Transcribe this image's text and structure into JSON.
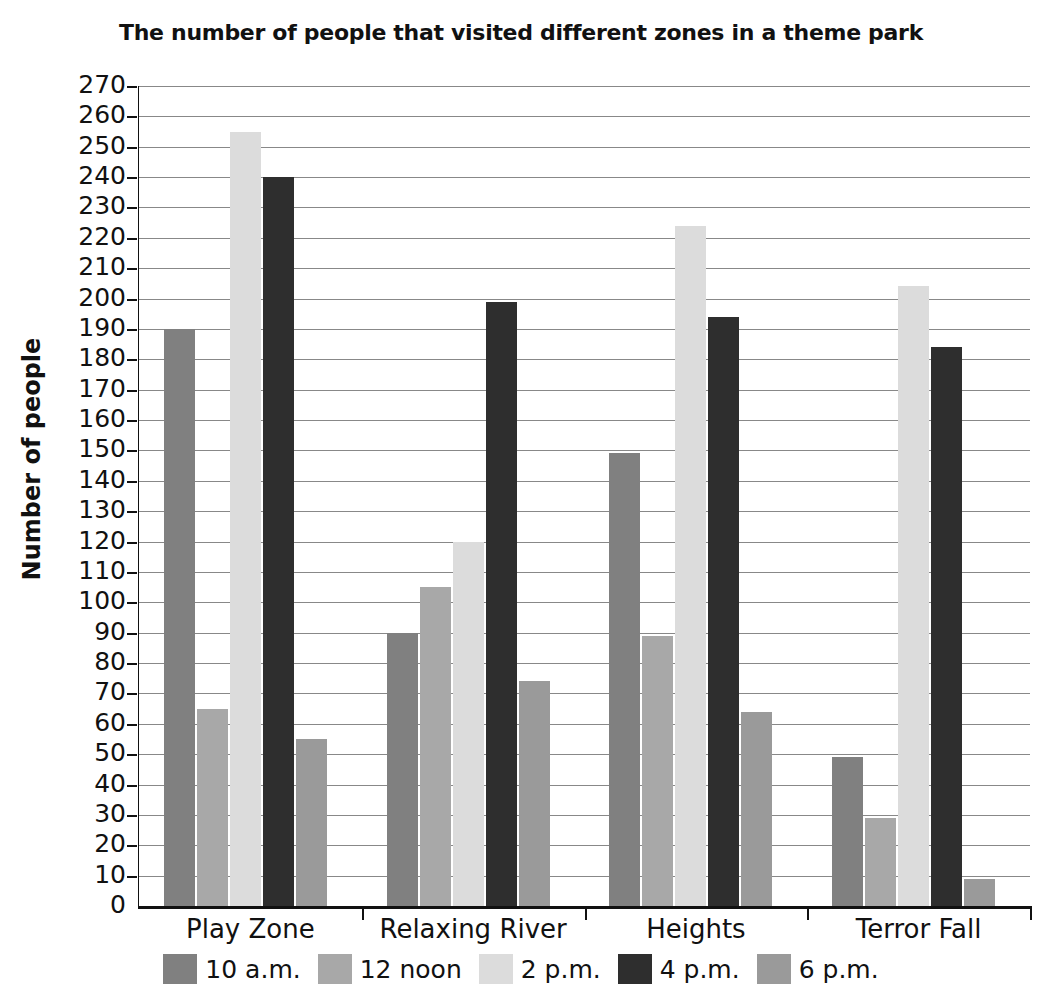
{
  "chart_data": {
    "type": "bar",
    "title": "The number of people that visited different zones in a theme park",
    "xlabel": "",
    "ylabel": "Number of people",
    "ylim": [
      0,
      270
    ],
    "ytick_step": 10,
    "yticks": [
      270,
      260,
      250,
      240,
      230,
      220,
      210,
      200,
      190,
      180,
      170,
      160,
      150,
      140,
      130,
      120,
      110,
      100,
      90,
      80,
      70,
      60,
      50,
      40,
      30,
      20,
      10,
      0
    ],
    "grid": true,
    "legend_position": "bottom",
    "categories": [
      "Play Zone",
      "Relaxing River",
      "Heights",
      "Terror Fall"
    ],
    "series": [
      {
        "name": "10 a.m.",
        "color": "#808080",
        "values": [
          190,
          90,
          149,
          49
        ]
      },
      {
        "name": "12 noon",
        "color": "#a8a8a8",
        "values": [
          65,
          105,
          89,
          29
        ]
      },
      {
        "name": "2 p.m.",
        "color": "#dcdcdc",
        "values": [
          255,
          120,
          224,
          204
        ]
      },
      {
        "name": "4 p.m.",
        "color": "#2e2e2e",
        "values": [
          240,
          199,
          194,
          184
        ]
      },
      {
        "name": "6 p.m.",
        "color": "#9a9a9a",
        "values": [
          55,
          74,
          64,
          9
        ]
      }
    ]
  }
}
